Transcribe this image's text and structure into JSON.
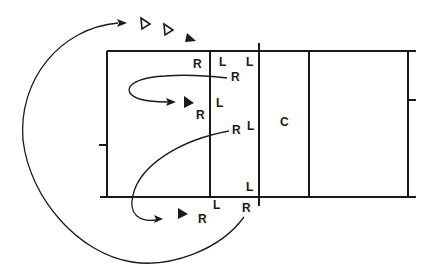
{
  "diagram": {
    "colors": {
      "ink": "#1a1a1a",
      "background": "#ffffff"
    },
    "court": {
      "outline": {
        "left": 107,
        "top": 51,
        "right": 408,
        "bottom": 197
      },
      "divider_lines_x": [
        210,
        259,
        309
      ],
      "zone_label": "C"
    },
    "labels": [
      {
        "id": "r1",
        "text": "R",
        "x": 193,
        "y": 68
      },
      {
        "id": "l1",
        "text": "L",
        "x": 219,
        "y": 66
      },
      {
        "id": "l2",
        "text": "L",
        "x": 246,
        "y": 66
      },
      {
        "id": "r2",
        "text": "R",
        "x": 231,
        "y": 80
      },
      {
        "id": "l3",
        "text": "L",
        "x": 216,
        "y": 106
      },
      {
        "id": "r3",
        "text": "R",
        "x": 197,
        "y": 118
      },
      {
        "id": "r4",
        "text": "R",
        "x": 232,
        "y": 133
      },
      {
        "id": "l4",
        "text": "L",
        "x": 247,
        "y": 130
      },
      {
        "id": "c",
        "text": "C",
        "x": 281,
        "y": 125
      },
      {
        "id": "l5",
        "text": "L",
        "x": 246,
        "y": 190
      },
      {
        "id": "l6",
        "text": "L",
        "x": 213,
        "y": 208
      },
      {
        "id": "r5",
        "text": "R",
        "x": 243,
        "y": 210
      },
      {
        "id": "r6",
        "text": "R",
        "x": 199,
        "y": 221
      }
    ],
    "markers": [
      {
        "id": "outline-triangle-1",
        "type": "outline",
        "x": 145,
        "y": 24
      },
      {
        "id": "outline-triangle-2",
        "type": "outline",
        "x": 168,
        "y": 30
      },
      {
        "id": "filled-triangle-1",
        "type": "filled",
        "x": 189,
        "y": 38
      },
      {
        "id": "filled-triangle-2",
        "type": "filled",
        "x": 188,
        "y": 102
      },
      {
        "id": "filled-triangle-3",
        "type": "filled",
        "x": 181,
        "y": 214
      }
    ]
  }
}
